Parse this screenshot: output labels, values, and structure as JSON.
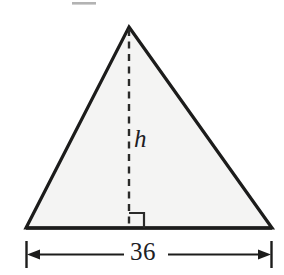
{
  "figure": {
    "kind": "geometry-diagram",
    "shape": "triangle",
    "background_color": "#ffffff",
    "fill_color": "#f4f4f3",
    "stroke_color": "#1c1c1b",
    "artifact_color": "#9a9a9a",
    "labels": {
      "height": "h",
      "base_measure": "36"
    },
    "icons": {
      "right_angle": "right-angle-marker",
      "left_arrow": "arrow-left-icon",
      "right_arrow": "arrow-right-icon"
    },
    "geometry": {
      "apex": [
        129,
        27
      ],
      "base_left": [
        26,
        228
      ],
      "base_right": [
        272,
        228
      ],
      "altitude_foot": [
        129,
        228
      ],
      "right_angle_size": 15,
      "dimension_line_y": 254,
      "dimension_tick_top": 241,
      "dimension_tick_bottom": 268
    }
  }
}
